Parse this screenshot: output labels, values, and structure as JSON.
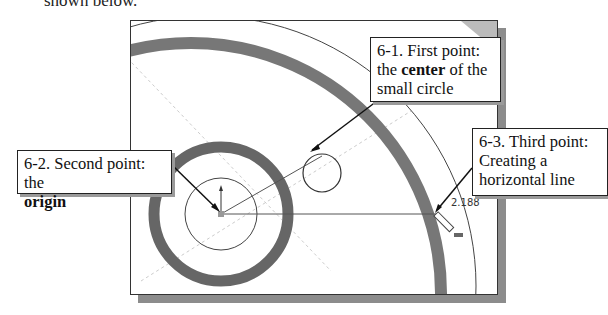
{
  "intro_text": "shown below.",
  "callouts": {
    "first": {
      "line1": "6-1. First point:",
      "pre": "the ",
      "bold": "center",
      "post": " of the",
      "line3": "small circle"
    },
    "second": {
      "line1": "6-2. Second point: the",
      "bold": "origin"
    },
    "third": {
      "line1": "6-3. Third point:",
      "line2": "Creating a",
      "line3": "horizontal line"
    }
  },
  "dimension_value": "2.188",
  "colors": {
    "ring_dark": "#5e5e5e",
    "ring_mid": "#8a8a8a",
    "shadow": "#8c8c8c",
    "line": "#333333"
  }
}
